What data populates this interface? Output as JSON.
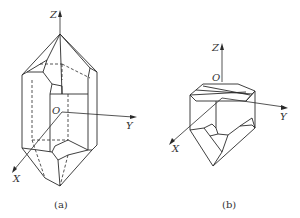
{
  "figure": {
    "panels": [
      {
        "id": "a",
        "caption": "(a)",
        "axes": {
          "z": "Z",
          "y": "Y",
          "x": "X",
          "origin": "O"
        }
      },
      {
        "id": "b",
        "caption": "(b)",
        "axes": {
          "z": "Z",
          "y": "Y",
          "x": "X",
          "origin": "O"
        }
      }
    ]
  }
}
